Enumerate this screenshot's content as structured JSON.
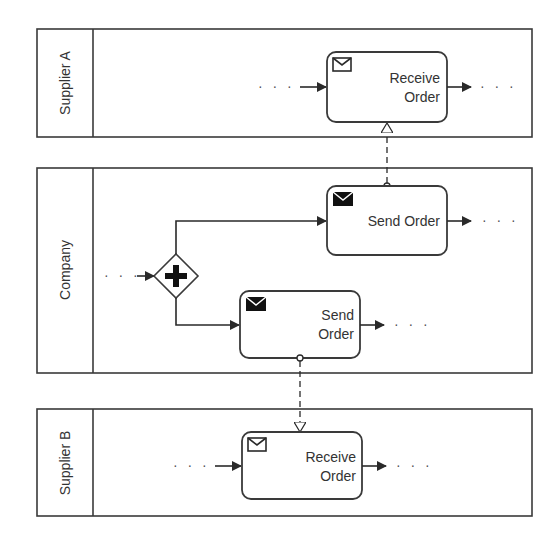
{
  "diagram": {
    "type": "BPMN collaboration",
    "lanes": [
      {
        "id": "supplier-a",
        "label": "Supplier A"
      },
      {
        "id": "company",
        "label": "Company"
      },
      {
        "id": "supplier-b",
        "label": "Supplier B"
      }
    ],
    "tasks": {
      "receive_a": {
        "line1": "Receive",
        "line2": "Order",
        "icon": "envelope-outline-icon"
      },
      "send_upper": {
        "line1": "Send Order",
        "icon": "envelope-filled-icon"
      },
      "send_lower": {
        "line1": "Send",
        "line2": "Order",
        "icon": "envelope-filled-icon"
      },
      "receive_b": {
        "line1": "Receive",
        "line2": "Order",
        "icon": "envelope-outline-icon"
      }
    },
    "gateway": {
      "type": "parallel",
      "symbol": "+"
    },
    "ellipsis": "· · ·"
  }
}
